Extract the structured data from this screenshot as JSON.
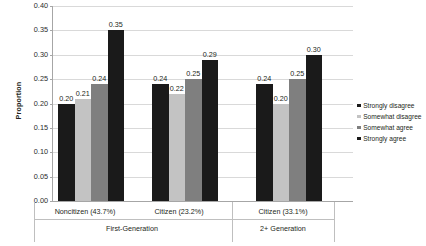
{
  "chart_data": {
    "type": "bar",
    "title": "",
    "xlabel": "",
    "ylabel": "Proportion",
    "ylim": [
      0,
      0.4
    ],
    "ytick_labels": [
      "0.40",
      "0.35",
      "0.30",
      "0.25",
      "0.20",
      "0.15",
      "0.10",
      "0.05",
      "0.00"
    ],
    "ytick_values": [
      0.4,
      0.35,
      0.3,
      0.25,
      0.2,
      0.15,
      0.1,
      0.05,
      0.0
    ],
    "grid": true,
    "legend_position": "right",
    "categories": [
      "Noncitizen (43.7%)",
      "Citizen (23.2%)",
      "Citizen (33.1%)"
    ],
    "supergroups": [
      {
        "label": "First-Generation",
        "categories": [
          "Noncitizen (43.7%)",
          "Citizen (23.2%)"
        ]
      },
      {
        "label": "2+ Generation",
        "categories": [
          "Citizen (33.1%)"
        ]
      }
    ],
    "series": [
      {
        "name": "Strongly disagree",
        "color": "#1a1a1a",
        "values": [
          0.2,
          0.24,
          0.24
        ],
        "labels": [
          "0.20",
          "0.24",
          "0.24"
        ]
      },
      {
        "name": "Somewhat disagree",
        "color": "#c3c3c3",
        "values": [
          0.21,
          0.22,
          0.2
        ],
        "labels": [
          "0.21",
          "0.22",
          "0.20"
        ]
      },
      {
        "name": "Somewhat agree",
        "color": "#7f7f7f",
        "values": [
          0.24,
          0.25,
          0.25
        ],
        "labels": [
          "0.24",
          "0.25",
          "0.25"
        ]
      },
      {
        "name": "Strongly agree",
        "color": "#1a1a1a",
        "values": [
          0.35,
          0.29,
          0.3
        ],
        "labels": [
          "0.35",
          "0.29",
          "0.30"
        ]
      }
    ]
  },
  "legend": {
    "items": [
      {
        "label": "Strongly disagree",
        "color": "#1a1a1a"
      },
      {
        "label": "Somewhat disagree",
        "color": "#c3c3c3"
      },
      {
        "label": "Somewhat agree",
        "color": "#7f7f7f"
      },
      {
        "label": "Strongly agree",
        "color": "#1a1a1a"
      }
    ]
  }
}
